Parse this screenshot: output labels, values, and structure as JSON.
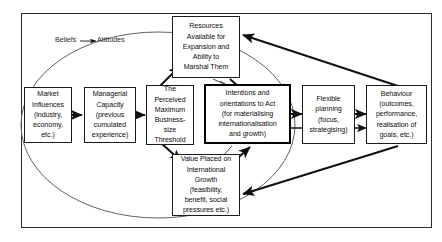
{
  "diagram": {
    "frame": {
      "name": "outer-frame"
    },
    "cycle": {
      "label_left": "Beliefs",
      "label_arrow": "→",
      "label_right": "Attitudes",
      "full_label": "Beliefs → Attitudes"
    },
    "colors": {
      "background": "#ffffff",
      "stroke": "#1a1a1a",
      "thick_stroke": "#000000",
      "ellipse": "#555555",
      "text": "#0d0d0d"
    },
    "nodes": [
      {
        "id": "market-influences",
        "label": "Market\nInfluences\n(industry,\neconomy,\netc.)",
        "emphasis": "normal"
      },
      {
        "id": "managerial-capacity",
        "label": "Managerial\nCapacity\n(previous\ncumulated\nexperience)",
        "emphasis": "normal"
      },
      {
        "id": "perceived-maximum-business-size-threshold",
        "label": "The\nPerceived\nMaximum\nBusiness-\nsize\nThreshold",
        "emphasis": "normal"
      },
      {
        "id": "resources-available",
        "label": "Resources\nAvailable for\nExpansion and\nAbility to\nMarshal Them",
        "emphasis": "normal"
      },
      {
        "id": "value-placed-international-growth",
        "label": "Value Placed on\nInternational\nGrowth\n(feasibility,\nbenefit, social\npressures etc.)",
        "emphasis": "normal"
      },
      {
        "id": "intentions-orientations-to-act",
        "label": "Intentions and\norientations to Act\n(for materialising\ninternationalisation\nand growth)",
        "emphasis": "thick"
      },
      {
        "id": "flexible-planning",
        "label": "Flexible\nplanning\n(focus,\nstrategising)",
        "emphasis": "normal"
      },
      {
        "id": "behaviour",
        "label": "Behaviour\n(outcomes,\nperformance,\nrealisation of\ngoals, etc.)",
        "emphasis": "normal"
      }
    ]
  }
}
